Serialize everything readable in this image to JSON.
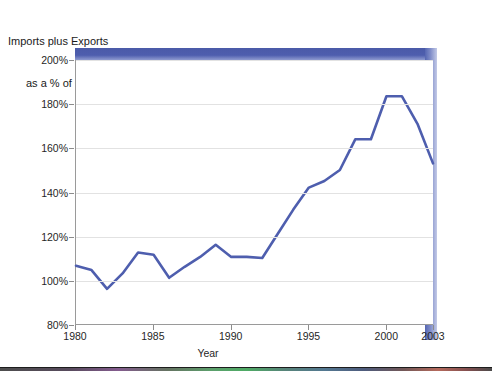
{
  "chart_data": {
    "type": "line",
    "title": "Imports plus Exports as a % of GDP",
    "title_line1": "Imports plus Exports",
    "title_line2": "as a % of GDP",
    "xlabel": "Year",
    "ylabel": "",
    "xlim": [
      1980,
      2003
    ],
    "ylim": [
      80,
      200
    ],
    "grid": true,
    "legend": "none",
    "line_color": "#4e5eae",
    "x_tick_labels": [
      "1980",
      "1985",
      "1990",
      "1995",
      "2000",
      "2003"
    ],
    "x_tick_values": [
      1980,
      1985,
      1990,
      1995,
      2000,
      2003
    ],
    "y_tick_labels": [
      "80%",
      "100%",
      "120%",
      "140%",
      "160%",
      "180%",
      "200%"
    ],
    "y_tick_values": [
      80,
      100,
      120,
      140,
      160,
      180,
      200
    ],
    "x": [
      1980,
      1981,
      1982,
      1983,
      1984,
      1985,
      1986,
      1987,
      1988,
      1989,
      1990,
      1991,
      1992,
      1993,
      1994,
      1995,
      1996,
      1997,
      1998,
      1999,
      2000,
      2001,
      2002,
      2003
    ],
    "series": [
      {
        "name": "Imports plus Exports as a % of GDP",
        "values": [
          106.5,
          104.5,
          96.0,
          103.0,
          112.5,
          111.5,
          101.0,
          106.0,
          110.5,
          116.0,
          110.5,
          110.5,
          110.0,
          121.0,
          132.0,
          142.0,
          145.0,
          150.0,
          164.0,
          164.0,
          183.5,
          183.5,
          171.0,
          153.0
        ]
      }
    ]
  }
}
